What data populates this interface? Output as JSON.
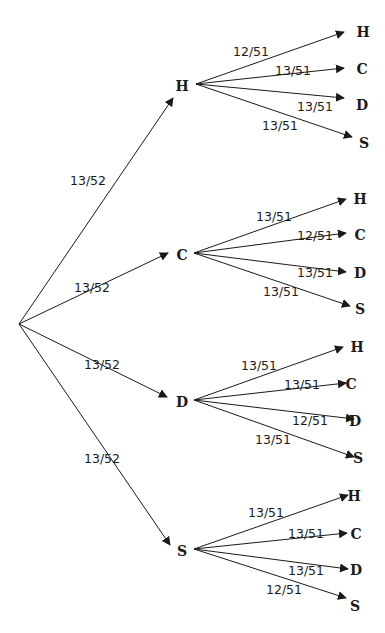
{
  "diagram": {
    "type": "probability-tree",
    "root": {
      "x": 19,
      "y": 324
    },
    "level1": [
      {
        "label": "H",
        "prob": "13/52",
        "node": {
          "x": 182,
          "y": 86
        },
        "tip": {
          "x": 173,
          "y": 98
        },
        "origin": {
          "x": 196,
          "y": 84
        },
        "prob_pos": {
          "x": 70,
          "y": 185
        }
      },
      {
        "label": "C",
        "prob": "13/52",
        "node": {
          "x": 182,
          "y": 255
        },
        "tip": {
          "x": 168,
          "y": 253
        },
        "origin": {
          "x": 194,
          "y": 253
        },
        "prob_pos": {
          "x": 74,
          "y": 292
        }
      },
      {
        "label": "D",
        "prob": "13/52",
        "node": {
          "x": 182,
          "y": 402
        },
        "tip": {
          "x": 167,
          "y": 397
        },
        "origin": {
          "x": 194,
          "y": 400
        },
        "prob_pos": {
          "x": 84,
          "y": 369
        }
      },
      {
        "label": "S",
        "prob": "13/52",
        "node": {
          "x": 182,
          "y": 551
        },
        "tip": {
          "x": 170,
          "y": 545
        },
        "origin": {
          "x": 194,
          "y": 549
        },
        "prob_pos": {
          "x": 84,
          "y": 463
        }
      }
    ],
    "level2": [
      {
        "parent": "H",
        "branches": [
          {
            "label": "H",
            "prob": "12/51",
            "tip": {
              "x": 344,
              "y": 32
            },
            "node": {
              "x": 363,
              "y": 37
            },
            "prob_pos": {
              "x": 233,
              "y": 56
            }
          },
          {
            "label": "C",
            "prob": "13/51",
            "tip": {
              "x": 344,
              "y": 68
            },
            "node": {
              "x": 362,
              "y": 74
            },
            "prob_pos": {
              "x": 275,
              "y": 75
            }
          },
          {
            "label": "D",
            "prob": "13/51",
            "tip": {
              "x": 344,
              "y": 98
            },
            "node": {
              "x": 362,
              "y": 110
            },
            "prob_pos": {
              "x": 297,
              "y": 111
            }
          },
          {
            "label": "S",
            "prob": "13/51",
            "tip": {
              "x": 352,
              "y": 137
            },
            "node": {
              "x": 364,
              "y": 148
            },
            "prob_pos": {
              "x": 262,
              "y": 130
            }
          }
        ]
      },
      {
        "parent": "C",
        "branches": [
          {
            "label": "H",
            "prob": "13/51",
            "tip": {
              "x": 346,
              "y": 199
            },
            "node": {
              "x": 360,
              "y": 204
            },
            "prob_pos": {
              "x": 256,
              "y": 221
            }
          },
          {
            "label": "C",
            "prob": "12/51",
            "tip": {
              "x": 346,
              "y": 233
            },
            "node": {
              "x": 360,
              "y": 240
            },
            "prob_pos": {
              "x": 297,
              "y": 240
            }
          },
          {
            "label": "D",
            "prob": "13/51",
            "tip": {
              "x": 346,
              "y": 272
            },
            "node": {
              "x": 360,
              "y": 278
            },
            "prob_pos": {
              "x": 297,
              "y": 277
            }
          },
          {
            "label": "S",
            "prob": "13/51",
            "tip": {
              "x": 350,
              "y": 306
            },
            "node": {
              "x": 360,
              "y": 314
            },
            "prob_pos": {
              "x": 263,
              "y": 296
            }
          }
        ]
      },
      {
        "parent": "D",
        "branches": [
          {
            "label": "H",
            "prob": "13/51",
            "tip": {
              "x": 343,
              "y": 347
            },
            "node": {
              "x": 357,
              "y": 352
            },
            "prob_pos": {
              "x": 241,
              "y": 370
            }
          },
          {
            "label": "C",
            "prob": "13/51",
            "tip": {
              "x": 346,
              "y": 383
            },
            "node": {
              "x": 351,
              "y": 389
            },
            "prob_pos": {
              "x": 284,
              "y": 389
            }
          },
          {
            "label": "D",
            "prob": "12/51",
            "tip": {
              "x": 354,
              "y": 419
            },
            "node": {
              "x": 355,
              "y": 426
            },
            "prob_pos": {
              "x": 292,
              "y": 425
            }
          },
          {
            "label": "S",
            "prob": "13/51",
            "tip": {
              "x": 354,
              "y": 457
            },
            "node": {
              "x": 358,
              "y": 463
            },
            "prob_pos": {
              "x": 255,
              "y": 444
            }
          }
        ]
      },
      {
        "parent": "S",
        "branches": [
          {
            "label": "H",
            "prob": "13/51",
            "tip": {
              "x": 348,
              "y": 495
            },
            "node": {
              "x": 354,
              "y": 501
            },
            "prob_pos": {
              "x": 248,
              "y": 517
            }
          },
          {
            "label": "C",
            "prob": "13/51",
            "tip": {
              "x": 347,
              "y": 533
            },
            "node": {
              "x": 356,
              "y": 539
            },
            "prob_pos": {
              "x": 288,
              "y": 538
            }
          },
          {
            "label": "D",
            "prob": "13/51",
            "tip": {
              "x": 348,
              "y": 569
            },
            "node": {
              "x": 356,
              "y": 575
            },
            "prob_pos": {
              "x": 288,
              "y": 575
            }
          },
          {
            "label": "S",
            "prob": "12/51",
            "tip": {
              "x": 346,
              "y": 598
            },
            "node": {
              "x": 355,
              "y": 611
            },
            "prob_pos": {
              "x": 266,
              "y": 594
            }
          }
        ]
      }
    ]
  }
}
